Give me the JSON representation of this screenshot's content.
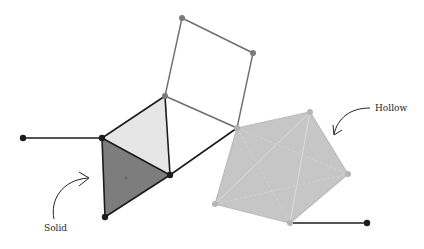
{
  "diagram": {
    "type": "simplicial-complex",
    "labels": {
      "solid": "Solid",
      "hollow": "Hollow"
    },
    "colors": {
      "edge_dark": "#1c1c1c",
      "edge_gray": "#6e6e6e",
      "vertex_dark": "#1c1c1c",
      "vertex_gray": "#7a7a7a",
      "vertex_light": "#b5b5b5",
      "light_face": "#e6e6e6",
      "solid_face": "#7d7d7d",
      "hollow_fill": "#c6c6c6",
      "hollow_edge": "#d8d8d8"
    },
    "vertices": {
      "sq_top": [
        182,
        18
      ],
      "sq_right": [
        253,
        53
      ],
      "sq_bottom": [
        237,
        128
      ],
      "sq_left": [
        165,
        96
      ],
      "left_end": [
        23,
        138
      ],
      "tri_left": [
        102,
        138
      ],
      "tri_right": [
        170,
        175
      ],
      "tri_bottom": [
        105,
        217
      ],
      "hollow_top": [
        310,
        112
      ],
      "hollow_right": [
        348,
        174
      ],
      "hollow_bottom": [
        290,
        223
      ],
      "hollow_left": [
        215,
        204
      ],
      "right_end": [
        367,
        223
      ],
      "solid_center": [
        126,
        178
      ]
    }
  }
}
